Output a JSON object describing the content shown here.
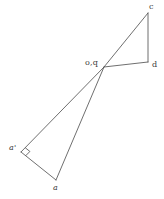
{
  "figure": {
    "canvas": {
      "width": 164,
      "height": 199,
      "background": "#ffffff"
    },
    "stroke": {
      "color": "#4a4a4a",
      "width": 0.8
    },
    "points": [
      {
        "id": "c",
        "label": "c",
        "x": 148,
        "y": 13,
        "label_x": 149,
        "label_y": 2,
        "style": "upright"
      },
      {
        "id": "d",
        "label": "d",
        "x": 148,
        "y": 62,
        "label_x": 152,
        "label_y": 60,
        "style": "upright"
      },
      {
        "id": "oq",
        "label": "o,q",
        "x": 104,
        "y": 67,
        "label_x": 85,
        "label_y": 58,
        "style": "upright"
      },
      {
        "id": "ap",
        "label": "a'",
        "x": 21,
        "y": 152,
        "label_x": 9,
        "label_y": 143,
        "style": "italic"
      },
      {
        "id": "a",
        "label": "a",
        "x": 56,
        "y": 180,
        "label_x": 53,
        "label_y": 183,
        "style": "italic"
      }
    ],
    "segments": [
      {
        "id": "oq-c",
        "from": "oq",
        "to": "c"
      },
      {
        "id": "c-d",
        "from": "c",
        "to": "d"
      },
      {
        "id": "d-oq",
        "from": "d",
        "to": "oq"
      },
      {
        "id": "oq-ap",
        "from": "oq",
        "to": "ap"
      },
      {
        "id": "ap-a",
        "from": "ap",
        "to": "a"
      },
      {
        "id": "a-oq",
        "from": "a",
        "to": "oq"
      }
    ],
    "right_angle_marker": {
      "at": "ap",
      "note": "right angle at a'",
      "size": 6
    }
  }
}
